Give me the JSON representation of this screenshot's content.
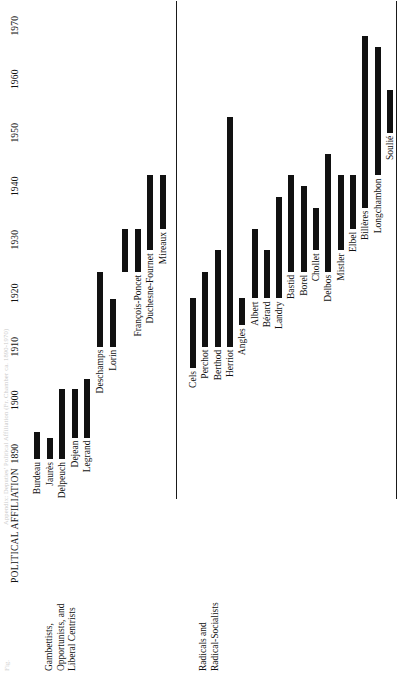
{
  "figure": {
    "running_head": "Appendix: Deputies' Political Affiliation (Fr. Chamber ca. 1890-1970)",
    "figure_number": "Fig.",
    "axis_title": "POLITICAL AFFILIATION"
  },
  "chart_data": {
    "type": "bar",
    "orientation": "horizontal-timeline",
    "title": "POLITICAL AFFILIATION",
    "xlabel": "",
    "ylabel": "",
    "xlim": [
      1886,
      1972
    ],
    "grid": false,
    "legend": false,
    "ticks": [
      1890,
      1900,
      1910,
      1920,
      1930,
      1940,
      1950,
      1960,
      1970
    ],
    "tick_labels": [
      "1890",
      "1900",
      "1910",
      "1920",
      "1930",
      "1940",
      "1950",
      "1960",
      "1970"
    ],
    "groups": [
      {
        "name": "Gambettists, Opportunists, and Liberal Centrists",
        "caption_lines": [
          "Gambettists,",
          "Opportunists, and",
          "Liberal Centrists"
        ],
        "bars": [
          {
            "label": "Burdeau",
            "start": 1889,
            "end": 1894
          },
          {
            "label": "Jaurès",
            "start": 1889,
            "end": 1893
          },
          {
            "label": "Delpeuch",
            "start": 1889,
            "end": 1902
          },
          {
            "label": "Dejean",
            "start": 1893,
            "end": 1902
          },
          {
            "label": "Legrand",
            "start": 1893,
            "end": 1904
          },
          {
            "label": "Deschamps",
            "start": 1910,
            "end": 1924
          },
          {
            "label": "Lorin",
            "start": 1910,
            "end": 1919
          },
          {
            "label": "Lorin2",
            "start": 1924,
            "end": 1932
          },
          {
            "label": "François-Poncet",
            "start": 1924,
            "end": 1932
          },
          {
            "label": "Duchesne-Fournet",
            "start": 1928,
            "end": 1942
          },
          {
            "label": "Mireaux",
            "start": 1932,
            "end": 1942
          }
        ]
      },
      {
        "name": "Radicals and Radical-Socialists",
        "caption_lines": [
          "Radicals and",
          "Radical-Socialists"
        ],
        "bars": [
          {
            "label": "Cels",
            "start": 1906,
            "end": 1919
          },
          {
            "label": "Perchot",
            "start": 1910,
            "end": 1924
          },
          {
            "label": "Berthod",
            "start": 1910,
            "end": 1928
          },
          {
            "label": "Herriot",
            "start": 1910,
            "end": 1953
          },
          {
            "label": "Angles",
            "start": 1914,
            "end": 1919
          },
          {
            "label": "Albert",
            "start": 1919,
            "end": 1932
          },
          {
            "label": "Bérard",
            "start": 1919,
            "end": 1928
          },
          {
            "label": "Landry",
            "start": 1919,
            "end": 1938
          },
          {
            "label": "Bastid",
            "start": 1924,
            "end": 1942
          },
          {
            "label": "Borel",
            "start": 1924,
            "end": 1940
          },
          {
            "label": "Chollet",
            "start": 1928,
            "end": 1936
          },
          {
            "label": "Delbos",
            "start": 1924,
            "end": 1946
          },
          {
            "label": "Mistler",
            "start": 1928,
            "end": 1942
          },
          {
            "label": "Elbel",
            "start": 1932,
            "end": 1942
          },
          {
            "label": "Billères",
            "start": 1936,
            "end": 1968
          },
          {
            "label": "Longchambon",
            "start": 1942,
            "end": 1966
          },
          {
            "label": "Soulié",
            "start": 1950,
            "end": 1958
          }
        ]
      }
    ]
  }
}
